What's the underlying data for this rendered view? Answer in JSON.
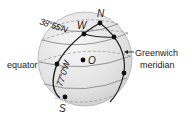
{
  "diagram": {
    "type": "globe-coordinates",
    "labels": {
      "north": "N",
      "south": "S",
      "west_point": "W",
      "center": "O",
      "latitude": "38°55′N",
      "longitude": "77°0′W",
      "equator": "equator",
      "greenwich_line1": "Greenwich",
      "greenwich_line2": "meridian"
    },
    "colors": {
      "sphere_fill": "#e4e4e4",
      "sphere_highlight": "#f6f6f6",
      "line": "#222222",
      "gray_line": "#8a8a8a",
      "dashed": "#9a9a9a",
      "text": "#1a1a1a"
    }
  }
}
